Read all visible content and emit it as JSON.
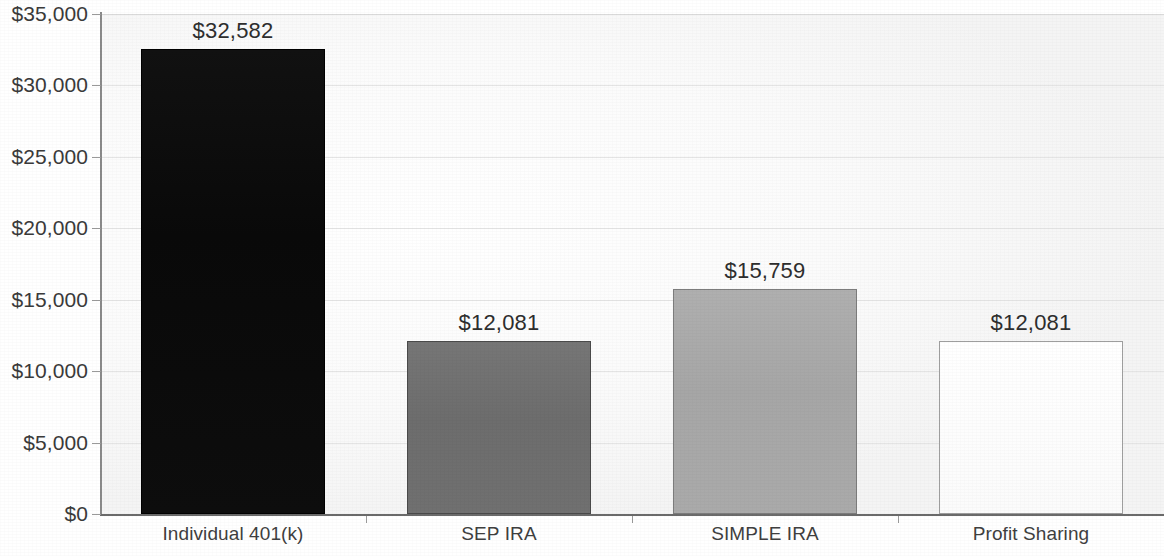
{
  "chart_data": {
    "type": "bar",
    "title": "",
    "subtitle": "",
    "xlabel": "",
    "ylabel": "",
    "categories": [
      "Individual 401(k)",
      "SEP IRA",
      "SIMPLE IRA",
      "Profit Sharing"
    ],
    "values": [
      32582,
      12081,
      15759,
      12081
    ],
    "value_labels": [
      "$32,582",
      "$12,081",
      "$15,759",
      "$12,081"
    ],
    "ylim": [
      0,
      35000
    ],
    "ytick_values": [
      0,
      5000,
      10000,
      15000,
      20000,
      25000,
      30000,
      35000
    ],
    "ytick_labels": [
      "$0",
      "$5,000",
      "$10,000",
      "$15,000",
      "$20,000",
      "$25,000",
      "$30,000",
      "$35,000"
    ],
    "grid": true,
    "grid_axis": "y",
    "legend": false,
    "legend_position": "none",
    "bar_colors": [
      "#0a0a0a",
      "#6f6f6f",
      "#a8a8a8",
      "#fdfdfd"
    ],
    "bar_border_colors": [
      "#000000",
      "#4a4a4a",
      "#7d7d7d",
      "#9e9e9e"
    ],
    "currency": "USD",
    "value_prefix": "$"
  },
  "axes": {
    "y_axis_name": "y-axis",
    "x_axis_name": "x-axis"
  }
}
